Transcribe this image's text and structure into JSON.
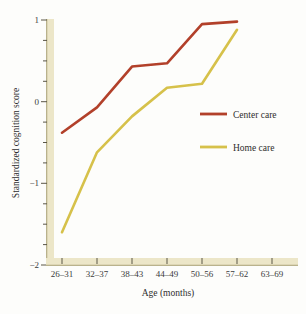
{
  "chart_data": {
    "type": "line",
    "title": "",
    "xlabel": "Age (months)",
    "ylabel": "Standardized cognition score",
    "categories": [
      "26–31",
      "32–37",
      "38–43",
      "44–49",
      "50–56",
      "57–62",
      "63–69"
    ],
    "ylim": [
      -2,
      1
    ],
    "y_ticks": [
      1,
      0,
      -1,
      -2
    ],
    "y_tick_labels": [
      "1",
      "0",
      "−1",
      "−2"
    ],
    "y_minor_tick_step": 0.25,
    "grid": false,
    "legend_position": "right-middle",
    "series": [
      {
        "name": "Center care",
        "color": "#b2402a",
        "x": [
          "26–31",
          "32–37",
          "38–43",
          "44–49",
          "50–56",
          "57–62"
        ],
        "values": [
          -0.38,
          -0.07,
          0.43,
          0.47,
          0.95,
          0.98
        ]
      },
      {
        "name": "Home care",
        "color": "#d6c14a",
        "x": [
          "26–31",
          "32–37",
          "38–43",
          "44–49",
          "50–56",
          "57–62"
        ],
        "values": [
          -1.6,
          -0.62,
          -0.18,
          0.17,
          0.22,
          0.88
        ]
      }
    ]
  },
  "axes": {
    "x_axis_title": "Age (months)",
    "y_axis_title": "Standardized cognition score",
    "x_tick_labels": [
      "26–31",
      "32–37",
      "38–43",
      "44–49",
      "50–56",
      "57–62",
      "63–69"
    ],
    "y_tick_labels": [
      "1",
      "0",
      "−1",
      "−2"
    ]
  },
  "legend": {
    "items": [
      {
        "label": "Center care",
        "color": "#b2402a"
      },
      {
        "label": "Home care",
        "color": "#d6c14a"
      }
    ]
  },
  "colors": {
    "center_care": "#b2402a",
    "home_care": "#d6c14a",
    "axis_band": "#ece6c8",
    "background": "#fdfdfb"
  }
}
